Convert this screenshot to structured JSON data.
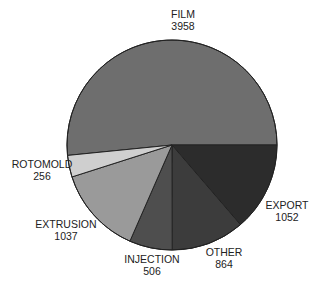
{
  "chart_data": {
    "type": "pie",
    "title": "",
    "slices": [
      {
        "label": "FILM",
        "value": 3958,
        "color": "#6e6e6e"
      },
      {
        "label": "EXPORT",
        "value": 1052,
        "color": "#2c2c2c"
      },
      {
        "label": "OTHER",
        "value": 864,
        "color": "#3c3c3c"
      },
      {
        "label": "INJECTION",
        "value": 506,
        "color": "#4e4e4e"
      },
      {
        "label": "EXTRUSION",
        "value": 1037,
        "color": "#9a9a9a"
      },
      {
        "label": "ROTOMOLD",
        "value": 256,
        "color": "#cfcfcf"
      }
    ],
    "total": 7673,
    "start_angle_deg": 0,
    "direction": "clockwise_from_3_oclock_for_lower_slices",
    "legend": "none (direct labels)"
  },
  "labels": {
    "film": {
      "name": "FILM",
      "value": "3958"
    },
    "export": {
      "name": "EXPORT",
      "value": "1052"
    },
    "other": {
      "name": "OTHER",
      "value": "864"
    },
    "injection": {
      "name": "INJECTION",
      "value": "506"
    },
    "extrusion": {
      "name": "EXTRUSION",
      "value": "1037"
    },
    "rotomold": {
      "name": "ROTOMOLD",
      "value": "256"
    }
  }
}
